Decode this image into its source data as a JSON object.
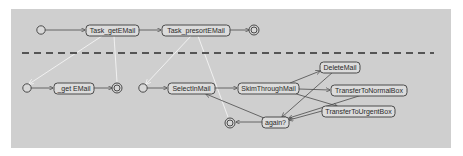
{
  "diagram": {
    "type": "UML activity / state diagram with task refinement",
    "colors": {
      "background": "#ffffff",
      "panel": "#cfcfcf",
      "node_fill": "#dcdcdc",
      "stroke": "#4a4a4a",
      "refinement_lines": "#f4f4f4",
      "divider": "#555555"
    },
    "top_level": {
      "nodes": [
        {
          "id": "start_top",
          "kind": "initial"
        },
        {
          "id": "task_get",
          "kind": "state",
          "label": "Task_getEMail"
        },
        {
          "id": "task_presort",
          "kind": "state",
          "label": "Task_presortEMail"
        },
        {
          "id": "end_top",
          "kind": "final"
        }
      ],
      "edges": [
        {
          "from": "start_top",
          "to": "task_get"
        },
        {
          "from": "task_get",
          "to": "task_presort"
        },
        {
          "from": "task_presort",
          "to": "end_top"
        }
      ]
    },
    "sub_get": {
      "nodes": [
        {
          "id": "start_get",
          "kind": "initial"
        },
        {
          "id": "get_email",
          "kind": "state",
          "label": "_get EMail"
        },
        {
          "id": "end_get",
          "kind": "final"
        }
      ],
      "edges": [
        {
          "from": "start_get",
          "to": "get_email"
        },
        {
          "from": "get_email",
          "to": "end_get"
        }
      ]
    },
    "sub_presort": {
      "nodes": [
        {
          "id": "start_presort",
          "kind": "initial"
        },
        {
          "id": "select_in_mail",
          "kind": "state",
          "label": "SelectInMail"
        },
        {
          "id": "skim_through_mail",
          "kind": "state",
          "label": "SkimThroughMail"
        },
        {
          "id": "delete_mail",
          "kind": "state",
          "label": "DeleteMail"
        },
        {
          "id": "transfer_normal",
          "kind": "state",
          "label": "TransferToNormalBox"
        },
        {
          "id": "transfer_urgent",
          "kind": "state",
          "label": "TransferToUrgentBox"
        },
        {
          "id": "again",
          "kind": "state",
          "label": "again?"
        },
        {
          "id": "end_presort",
          "kind": "final"
        }
      ],
      "edges": [
        {
          "from": "start_presort",
          "to": "select_in_mail"
        },
        {
          "from": "select_in_mail",
          "to": "skim_through_mail"
        },
        {
          "from": "skim_through_mail",
          "to": "delete_mail"
        },
        {
          "from": "skim_through_mail",
          "to": "transfer_normal"
        },
        {
          "from": "skim_through_mail",
          "to": "transfer_urgent"
        },
        {
          "from": "delete_mail",
          "to": "again"
        },
        {
          "from": "transfer_normal",
          "to": "again"
        },
        {
          "from": "transfer_urgent",
          "to": "again"
        },
        {
          "from": "again",
          "to": "select_in_mail"
        },
        {
          "from": "again",
          "to": "end_presort"
        }
      ]
    },
    "refinement_links": [
      {
        "from": "task_get",
        "to": "start_get"
      },
      {
        "from": "task_get",
        "to": "end_get"
      },
      {
        "from": "task_presort",
        "to": "start_presort"
      },
      {
        "from": "task_presort",
        "to": "end_presort"
      }
    ]
  }
}
